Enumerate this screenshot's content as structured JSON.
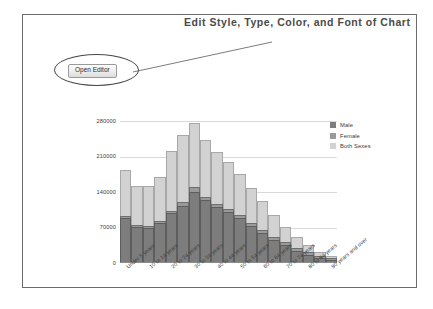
{
  "annotation": {
    "title": "Edit Style, Type, Color, and Font of Chart"
  },
  "toolbar": {
    "open_editor_label": "Open Editor"
  },
  "legend": {
    "position": "right",
    "items": [
      {
        "label": "Male",
        "color": "#7d7d7d"
      },
      {
        "label": "Female",
        "color": "#9a9a9a"
      },
      {
        "label": "Both Sexes",
        "color": "#d2d2d2"
      }
    ]
  },
  "chart_data": {
    "type": "bar",
    "title": "",
    "xlabel": "",
    "ylabel": "",
    "grid": true,
    "stacked": true,
    "ylim": [
      0,
      280000
    ],
    "yticks": [
      0,
      70000,
      140000,
      210000,
      280000
    ],
    "ytick_labels": [
      "0",
      "70000",
      "140000",
      "210000",
      "280000"
    ],
    "categories": [
      "Under 5 years",
      "5 to 9 years",
      "10 to 14 years",
      "15 to 19 years",
      "20 to 24 years",
      "25 to 29 years",
      "30 to 34 years",
      "35 to 39 years",
      "40 to 44 years",
      "45 to 49 years",
      "50 to 54 years",
      "55 to 59 years",
      "60 to 64 years",
      "65 to 69 years",
      "70 to 74 years",
      "75 to 79 years",
      "80 to 84 years",
      "85 to 89 years",
      "90 years and over"
    ],
    "xtick_labels": [
      "Under 5 years",
      "10 to 14 years",
      "20 to 24 years",
      "30 to 34 years",
      "40 to 44 years",
      "50 to 54 years",
      "60 to 64 years",
      "70 to 74 years",
      "80 to 84 years",
      "90 years and over"
    ],
    "xtick_indices": [
      0,
      2,
      4,
      6,
      8,
      10,
      12,
      14,
      16,
      18
    ],
    "series": [
      {
        "name": "Male",
        "color": "#7d7d7d",
        "values": [
          88000,
          72000,
          70000,
          78000,
          98000,
          113000,
          140000,
          124000,
          110000,
          100000,
          88000,
          73000,
          60000,
          46000,
          35000,
          24000,
          16000,
          9000,
          5000
        ]
      },
      {
        "name": "Female",
        "color": "#9a9a9a",
        "values": [
          4000,
          3000,
          3000,
          4000,
          5000,
          8000,
          9000,
          7000,
          7000,
          7000,
          6000,
          6000,
          6000,
          6000,
          6000,
          6000,
          6000,
          5000,
          4000
        ]
      },
      {
        "name": "Both Sexes",
        "color": "#d2d2d2",
        "values": [
          91000,
          76000,
          79000,
          88000,
          117000,
          132000,
          128000,
          112000,
          101000,
          92000,
          81000,
          68000,
          56000,
          43000,
          31000,
          21000,
          13000,
          7000,
          4000
        ]
      }
    ],
    "totals": [
      183000,
      151000,
      152000,
      170000,
      220000,
      253000,
      277000,
      243000,
      218000,
      199000,
      175000,
      147000,
      122000,
      95000,
      72000,
      51000,
      35000,
      21000,
      13000
    ]
  }
}
